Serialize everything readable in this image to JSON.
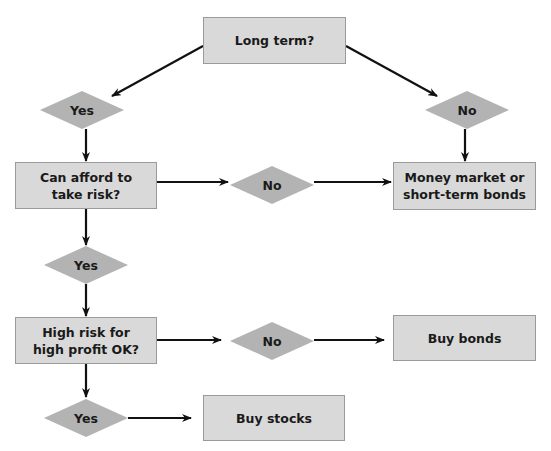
{
  "diagram": {
    "type": "flowchart",
    "colors": {
      "box_fill": "#d9d9d9",
      "diamond_fill": "#b3b3b3",
      "arrow": "#111111",
      "text": "#1a1a1a"
    },
    "nodes": {
      "long_term": "Long term?",
      "yes_1": "Yes",
      "no_1": "No",
      "can_afford": "Can afford to\ntake risk?",
      "no_2": "No",
      "money_market": "Money market or\nshort-term bonds",
      "yes_2": "Yes",
      "high_risk": "High risk for\nhigh profit OK?",
      "no_3": "No",
      "buy_bonds": "Buy bonds",
      "yes_3": "Yes",
      "buy_stocks": "Buy stocks"
    },
    "edges": [
      [
        "long_term",
        "yes_1"
      ],
      [
        "long_term",
        "no_1"
      ],
      [
        "yes_1",
        "can_afford"
      ],
      [
        "no_1",
        "money_market"
      ],
      [
        "can_afford",
        "no_2"
      ],
      [
        "no_2",
        "money_market"
      ],
      [
        "can_afford",
        "yes_2"
      ],
      [
        "yes_2",
        "high_risk"
      ],
      [
        "high_risk",
        "no_3"
      ],
      [
        "no_3",
        "buy_bonds"
      ],
      [
        "high_risk",
        "yes_3"
      ],
      [
        "yes_3",
        "buy_stocks"
      ]
    ]
  }
}
